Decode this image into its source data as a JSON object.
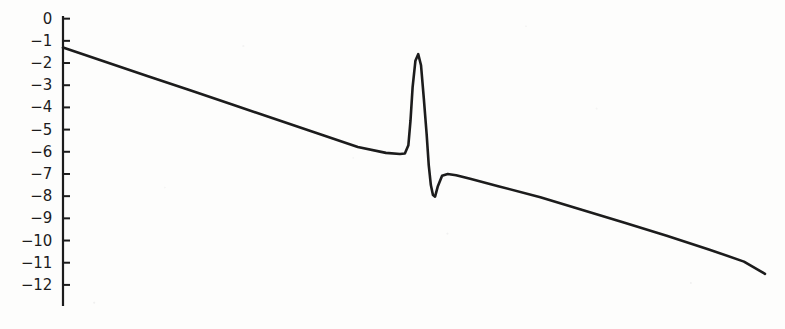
{
  "chart_data": {
    "type": "line",
    "title": "",
    "subtitle": "",
    "xlabel": "",
    "ylabel": "",
    "grid": false,
    "legend": null,
    "annotations": [],
    "xlim": [
      0,
      1
    ],
    "ylim": [
      -12.5,
      0.3
    ],
    "y_ticks": [
      0,
      -1,
      -2,
      -3,
      -4,
      -5,
      -6,
      -7,
      -8,
      -9,
      -10,
      -11,
      -12
    ],
    "y_tick_labels": [
      "0",
      "−1",
      "−2",
      "−3",
      "−4",
      "−5",
      "−6",
      "−7",
      "−8",
      "−9",
      "−10",
      "−11",
      "−12"
    ],
    "x_ticks": [],
    "x_tick_labels": [],
    "axis_color": "#1c1c1c",
    "line_color": "#1c1c1c",
    "line_width": 2.6,
    "background_color": "#fdfdfc",
    "series": [
      {
        "name": "response",
        "x": [
          0.0,
          0.06,
          0.12,
          0.18,
          0.24,
          0.3,
          0.36,
          0.42,
          0.46,
          0.48,
          0.487,
          0.492,
          0.495,
          0.498,
          0.502,
          0.506,
          0.51,
          0.514,
          0.518,
          0.521,
          0.524,
          0.527,
          0.53,
          0.534,
          0.54,
          0.548,
          0.56,
          0.58,
          0.62,
          0.68,
          0.74,
          0.8,
          0.86,
          0.92,
          0.97,
          1.0
        ],
        "y": [
          -1.3,
          -1.94,
          -2.58,
          -3.22,
          -3.86,
          -4.5,
          -5.14,
          -5.78,
          -6.05,
          -6.1,
          -6.08,
          -5.7,
          -4.6,
          -3.1,
          -1.9,
          -1.6,
          -2.1,
          -3.6,
          -5.2,
          -6.6,
          -7.5,
          -7.95,
          -8.02,
          -7.55,
          -7.08,
          -7.0,
          -7.06,
          -7.22,
          -7.55,
          -8.05,
          -8.62,
          -9.2,
          -9.78,
          -10.4,
          -10.95,
          -11.5
        ]
      }
    ]
  },
  "axis": {
    "y_axis_top_value": 0.28,
    "y_axis_bottom_value": -12.55,
    "tick_length_px": 7
  }
}
